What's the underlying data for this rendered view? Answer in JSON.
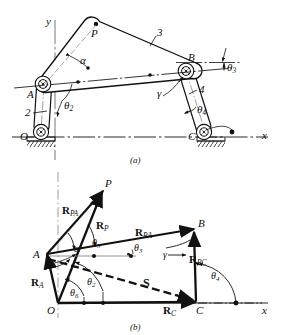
{
  "figure": {
    "subfigures": [
      {
        "id": "a",
        "caption": "(a)",
        "description": "Four-bar linkage mechanism skeleton"
      },
      {
        "id": "b",
        "caption": "(b)",
        "description": "Vector polygon of the same linkage"
      }
    ]
  },
  "colors": {
    "ink": "#111111",
    "paper": "#ffffff",
    "centerline": "#555555"
  },
  "subfig_a": {
    "caption": "(a)",
    "axes": {
      "x": "x",
      "y": "y"
    },
    "points": [
      {
        "name": "O",
        "label": "O"
      },
      {
        "name": "A",
        "label": "A"
      },
      {
        "name": "B",
        "label": "B"
      },
      {
        "name": "C",
        "label": "C"
      },
      {
        "name": "P",
        "label": "P"
      }
    ],
    "links": [
      {
        "name": "link-2",
        "label": "2"
      },
      {
        "name": "link-3",
        "label": "3"
      },
      {
        "name": "link-4",
        "label": "4"
      }
    ],
    "angles": [
      {
        "name": "alpha",
        "label": "α"
      },
      {
        "name": "theta2",
        "label": "θ",
        "sub": "2"
      },
      {
        "name": "theta3",
        "label": "θ",
        "sub": "3"
      },
      {
        "name": "theta4",
        "label": "θ",
        "sub": "4"
      },
      {
        "name": "gamma",
        "label": "γ"
      }
    ]
  },
  "subfig_b": {
    "caption": "(b)",
    "axes": {
      "x": "x"
    },
    "points": [
      {
        "name": "O",
        "label": "O"
      },
      {
        "name": "A",
        "label": "A"
      },
      {
        "name": "B",
        "label": "B"
      },
      {
        "name": "C",
        "label": "C"
      },
      {
        "name": "P",
        "label": "P"
      }
    ],
    "vectors": [
      {
        "name": "R-PA",
        "label": "R",
        "sub": "PA"
      },
      {
        "name": "R-P",
        "label": "R",
        "sub": "P"
      },
      {
        "name": "R-BA",
        "label": "R",
        "sub": "BA"
      },
      {
        "name": "R-BC",
        "label": "R",
        "sub": "BC"
      },
      {
        "name": "R-A",
        "label": "R",
        "sub": "A"
      },
      {
        "name": "R-C",
        "label": "R",
        "sub": "C"
      },
      {
        "name": "S",
        "label": "S",
        "sub": ""
      }
    ],
    "angles": [
      {
        "name": "alpha",
        "label": "α"
      },
      {
        "name": "theta2",
        "label": "θ",
        "sub": "2"
      },
      {
        "name": "theta3",
        "label": "θ",
        "sub": "3"
      },
      {
        "name": "theta4",
        "label": "θ",
        "sub": "4"
      },
      {
        "name": "theta5",
        "label": "θ",
        "sub": "5"
      },
      {
        "name": "theta6",
        "label": "θ",
        "sub": "6"
      },
      {
        "name": "gamma",
        "label": "γ"
      }
    ]
  }
}
